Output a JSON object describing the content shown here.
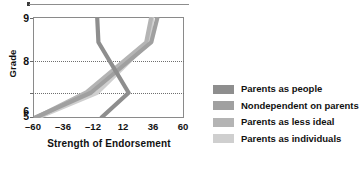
{
  "figure": {
    "background": "#ffffff"
  },
  "chart_data": {
    "type": "line",
    "title": "",
    "xlabel": "Strength of Endorsement",
    "ylabel": "Grade",
    "orientation": "x-is-value, y-is-grade",
    "xlim": [
      -60,
      60
    ],
    "ylim": [
      5,
      9
    ],
    "xticks": [
      -60,
      -36,
      -12,
      12,
      36,
      60
    ],
    "xticklabels": [
      "–60",
      "–36",
      "–12",
      "12",
      "36",
      "60"
    ],
    "yticks": [
      5,
      6,
      8,
      9
    ],
    "yticklabels": [
      "5",
      "6",
      "8",
      "9"
    ],
    "grid": "horizontal dotted gridlines at grade 6 and grade 8",
    "legend_position": "right",
    "series": [
      {
        "name": "Parents as people",
        "color": "#8e8e8e",
        "points": [
          {
            "grade": 5,
            "value": -6
          },
          {
            "grade": 6,
            "value": 16
          },
          {
            "grade": 8,
            "value": -8
          },
          {
            "grade": 9,
            "value": -9
          }
        ]
      },
      {
        "name": "Nondependent on parents",
        "color": "#a0a0a0",
        "points": [
          {
            "grade": 5,
            "value": -59
          },
          {
            "grade": 6,
            "value": -14
          },
          {
            "grade": 8,
            "value": 34
          },
          {
            "grade": 9,
            "value": 39
          }
        ]
      },
      {
        "name": "Parents as less ideal",
        "color": "#b4b4b4",
        "points": [
          {
            "grade": 5,
            "value": -58
          },
          {
            "grade": 6,
            "value": -18
          },
          {
            "grade": 8,
            "value": 30
          },
          {
            "grade": 9,
            "value": 34
          }
        ]
      },
      {
        "name": "Parents as individuals",
        "color": "#cfcfcf",
        "points": [
          {
            "grade": 5,
            "value": -57
          },
          {
            "grade": 6,
            "value": -9
          },
          {
            "grade": 8,
            "value": 32
          },
          {
            "grade": 9,
            "value": 35
          }
        ]
      }
    ]
  },
  "axes": {
    "y_title": "Grade",
    "x_title": "Strength of Endorsement",
    "y_labels": [
      "9",
      "8",
      "6",
      "5"
    ],
    "x_labels": [
      "–60",
      "–36",
      "–12",
      "12",
      "36",
      "60"
    ]
  },
  "legend": {
    "items": [
      {
        "label": "Parents as people",
        "color": "#8e8e8e"
      },
      {
        "label": "Nondependent on parents",
        "color": "#a0a0a0"
      },
      {
        "label": "Parents as less ideal",
        "color": "#b4b4b4"
      },
      {
        "label": "Parents as individuals",
        "color": "#cfcfcf"
      }
    ]
  }
}
